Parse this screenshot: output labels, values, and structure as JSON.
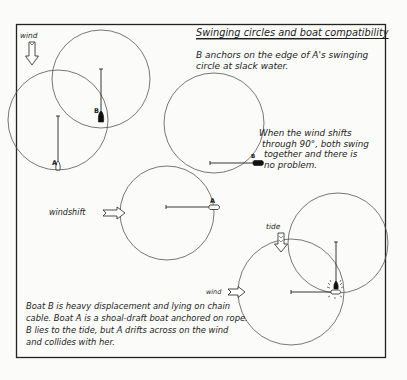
{
  "title": "Swinging circles and boat compatibility",
  "intro_text": [
    "B anchors  on the edge of A's swinging",
    "circle at slack water."
  ],
  "panel_1": {
    "wind_label": "wind",
    "wind_arrow_direction": "down",
    "boat_a_label": "A",
    "boat_b_label": "B"
  },
  "panel_2": {
    "windshift_label": "windshift",
    "windshift_arrow_direction": "right",
    "boat_a_label": "A",
    "boat_b_label": "B",
    "note": [
      "When the wind shifts",
      "through 90°, both swing",
      "together and there is",
      "no problem."
    ]
  },
  "panel_3": {
    "tide_label": "tide",
    "tide_arrow_direction": "down",
    "wind_label": "wind",
    "wind_arrow_direction": "right",
    "collision": true
  },
  "caption": [
    "Boat  B is heavy displacement and lying on chain",
    "cable. Boat A is a shoal-draft boat anchored on rope.",
    "B lies to the tide, but A drifts across on the wind",
    "and collides with her."
  ],
  "colors": {
    "ink": "#1a1a1a",
    "circle": "#6b6b6b",
    "paper": "#fbfbf9"
  }
}
